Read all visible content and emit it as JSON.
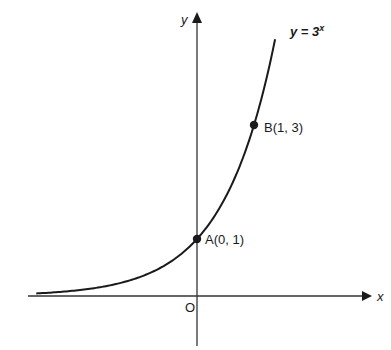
{
  "chart_data": {
    "type": "line",
    "title": "",
    "xlabel": "x",
    "ylabel": "y",
    "origin_label": "O",
    "function_label": {
      "prefix": "y = 3",
      "exponent": "x"
    },
    "grid": false,
    "legend": null,
    "series": [
      {
        "name": "y = 3^x",
        "x": [
          -2.82,
          -2.5,
          -2.0,
          -1.5,
          -1.0,
          -0.5,
          0.0,
          0.25,
          0.5,
          0.75,
          1.0,
          1.2,
          1.37
        ],
        "y": [
          0.045,
          0.064,
          0.111,
          0.192,
          0.333,
          0.577,
          1.0,
          1.316,
          1.732,
          2.28,
          3.0,
          3.737,
          4.5
        ]
      }
    ],
    "points": [
      {
        "name": "A",
        "label": "A(0, 1)",
        "x": 0,
        "y": 1
      },
      {
        "name": "B",
        "label": "B(1, 3)",
        "x": 1,
        "y": 3
      }
    ],
    "xlim": [
      -3.0,
      3.2
    ],
    "ylim": [
      -0.85,
      4.95
    ]
  },
  "colors": {
    "ink": "#1a1a1a",
    "axis": "#333333",
    "background": "#ffffff"
  },
  "layout": {
    "origin_px": [
      197,
      296
    ],
    "unit_px": 57
  }
}
